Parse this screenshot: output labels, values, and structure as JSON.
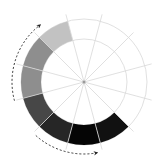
{
  "diagram": {
    "type": "radial-segment-wheel",
    "center": [
      84,
      82
    ],
    "outer_radius": 63,
    "inner_radius": 43,
    "guide_radii": [
      43,
      63
    ],
    "spoke_count": 12,
    "spoke_offset_deg": 15,
    "spoke_length": 70,
    "colors": {
      "background": "#ffffff",
      "guide": "#d8d8d8",
      "center_dot": "#9a9a9a",
      "arrow": "#222222"
    },
    "segments": [
      {
        "name": "segment-light-gray",
        "start_deg": 315,
        "end_deg": 345,
        "fill": "#c2c2c2"
      },
      {
        "name": "segment-mid-gray-1",
        "start_deg": 285,
        "end_deg": 315,
        "fill": "#8e8e8e"
      },
      {
        "name": "segment-mid-gray-2",
        "start_deg": 255,
        "end_deg": 285,
        "fill": "#8e8e8e"
      },
      {
        "name": "segment-dark-gray",
        "start_deg": 225,
        "end_deg": 255,
        "fill": "#474747"
      },
      {
        "name": "segment-darker-gray",
        "start_deg": 195,
        "end_deg": 225,
        "fill": "#262626"
      },
      {
        "name": "segment-black",
        "start_deg": 165,
        "end_deg": 195,
        "fill": "#050505"
      },
      {
        "name": "segment-near-black",
        "start_deg": 135,
        "end_deg": 165,
        "fill": "#111111"
      }
    ],
    "arrows": [
      {
        "name": "arrow-upward-left",
        "radius": 72,
        "start_deg": 255,
        "end_deg": 322
      },
      {
        "name": "arrow-downward-bottom",
        "radius": 72,
        "start_deg": 222,
        "end_deg": 170
      }
    ]
  }
}
